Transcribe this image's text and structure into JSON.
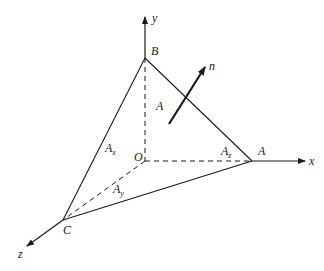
{
  "diagram": {
    "type": "tetrahedron-3d-axes",
    "colors": {
      "line": "#1a1a1a",
      "background": "#ffffff"
    },
    "axes": {
      "x": {
        "label": "x"
      },
      "y": {
        "label": "y"
      },
      "z": {
        "label": "z"
      }
    },
    "vertices": {
      "origin": {
        "label": "O"
      },
      "a": {
        "label": "A"
      },
      "b": {
        "label": "B"
      },
      "c": {
        "label": "C"
      }
    },
    "faces": {
      "main": {
        "label": "A"
      },
      "x": {
        "base": "A",
        "sub": "x"
      },
      "y": {
        "base": "A",
        "sub": "y"
      },
      "z": {
        "base": "A",
        "sub": "z"
      }
    },
    "normal_vector": {
      "label": "n"
    }
  }
}
